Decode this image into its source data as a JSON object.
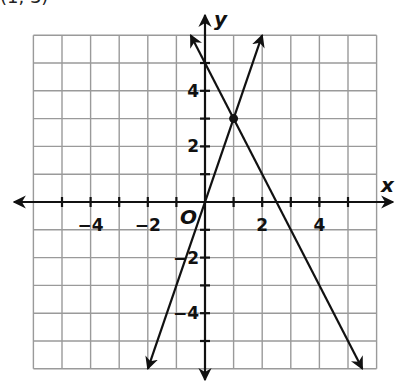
{
  "caption": "(1, 3)",
  "chart_data": {
    "type": "line",
    "title": "",
    "xlabel": "x",
    "ylabel": "y",
    "origin_label": "O",
    "xlim": [
      -6,
      6
    ],
    "ylim": [
      -6,
      6
    ],
    "grid": true,
    "grid_step": 1,
    "x_tick_labels": [
      {
        "value": -4,
        "label": "−4"
      },
      {
        "value": -2,
        "label": "−2"
      },
      {
        "value": 2,
        "label": "2"
      },
      {
        "value": 4,
        "label": "4"
      }
    ],
    "y_tick_labels": [
      {
        "value": 4,
        "label": "4"
      },
      {
        "value": 2,
        "label": "2"
      },
      {
        "value": -2,
        "label": "−2"
      },
      {
        "value": -4,
        "label": "−4"
      }
    ],
    "series": [
      {
        "name": "y = 3x",
        "slope": 3,
        "intercept": 0,
        "x": [
          -2,
          2
        ],
        "y": [
          -6,
          6
        ]
      },
      {
        "name": "y = -2x + 5",
        "slope": -2,
        "intercept": 5,
        "x": [
          -0.5,
          5.5
        ],
        "y": [
          6,
          -6
        ]
      }
    ],
    "points": [
      {
        "x": 1,
        "y": 3,
        "label": "intersection"
      }
    ]
  }
}
